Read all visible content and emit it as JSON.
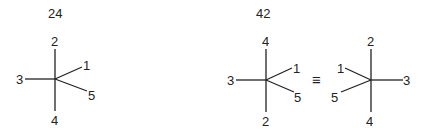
{
  "diagrams": [
    {
      "label": "24",
      "top": "2",
      "bottom": "4",
      "left": "3",
      "upper_right": "1",
      "lower_right": "5"
    },
    {
      "label": "42",
      "top": "4",
      "bottom": "2",
      "left": "3",
      "upper_right": "1",
      "lower_right": "5"
    },
    {
      "top": "2",
      "bottom": "4",
      "right": "3",
      "upper_left": "1",
      "lower_left": "5"
    }
  ],
  "equivalence_symbol": "≡"
}
